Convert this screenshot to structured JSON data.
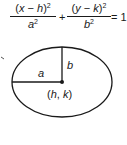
{
  "equation": {
    "num1_var": "x",
    "num1_op": " − ",
    "num1_const": "h",
    "num1_exp": "2",
    "den1_var": "a",
    "den1_exp": "2",
    "plus": "+",
    "num2_var": "y",
    "num2_op": " − ",
    "num2_const": "k",
    "num2_exp": "2",
    "den2_var": "b",
    "den2_exp": "2",
    "equals": "= 1"
  },
  "diagram": {
    "label_a": "a",
    "label_b": "b",
    "label_center": "(h, k)",
    "stroke_color": "#1a1a1a"
  }
}
